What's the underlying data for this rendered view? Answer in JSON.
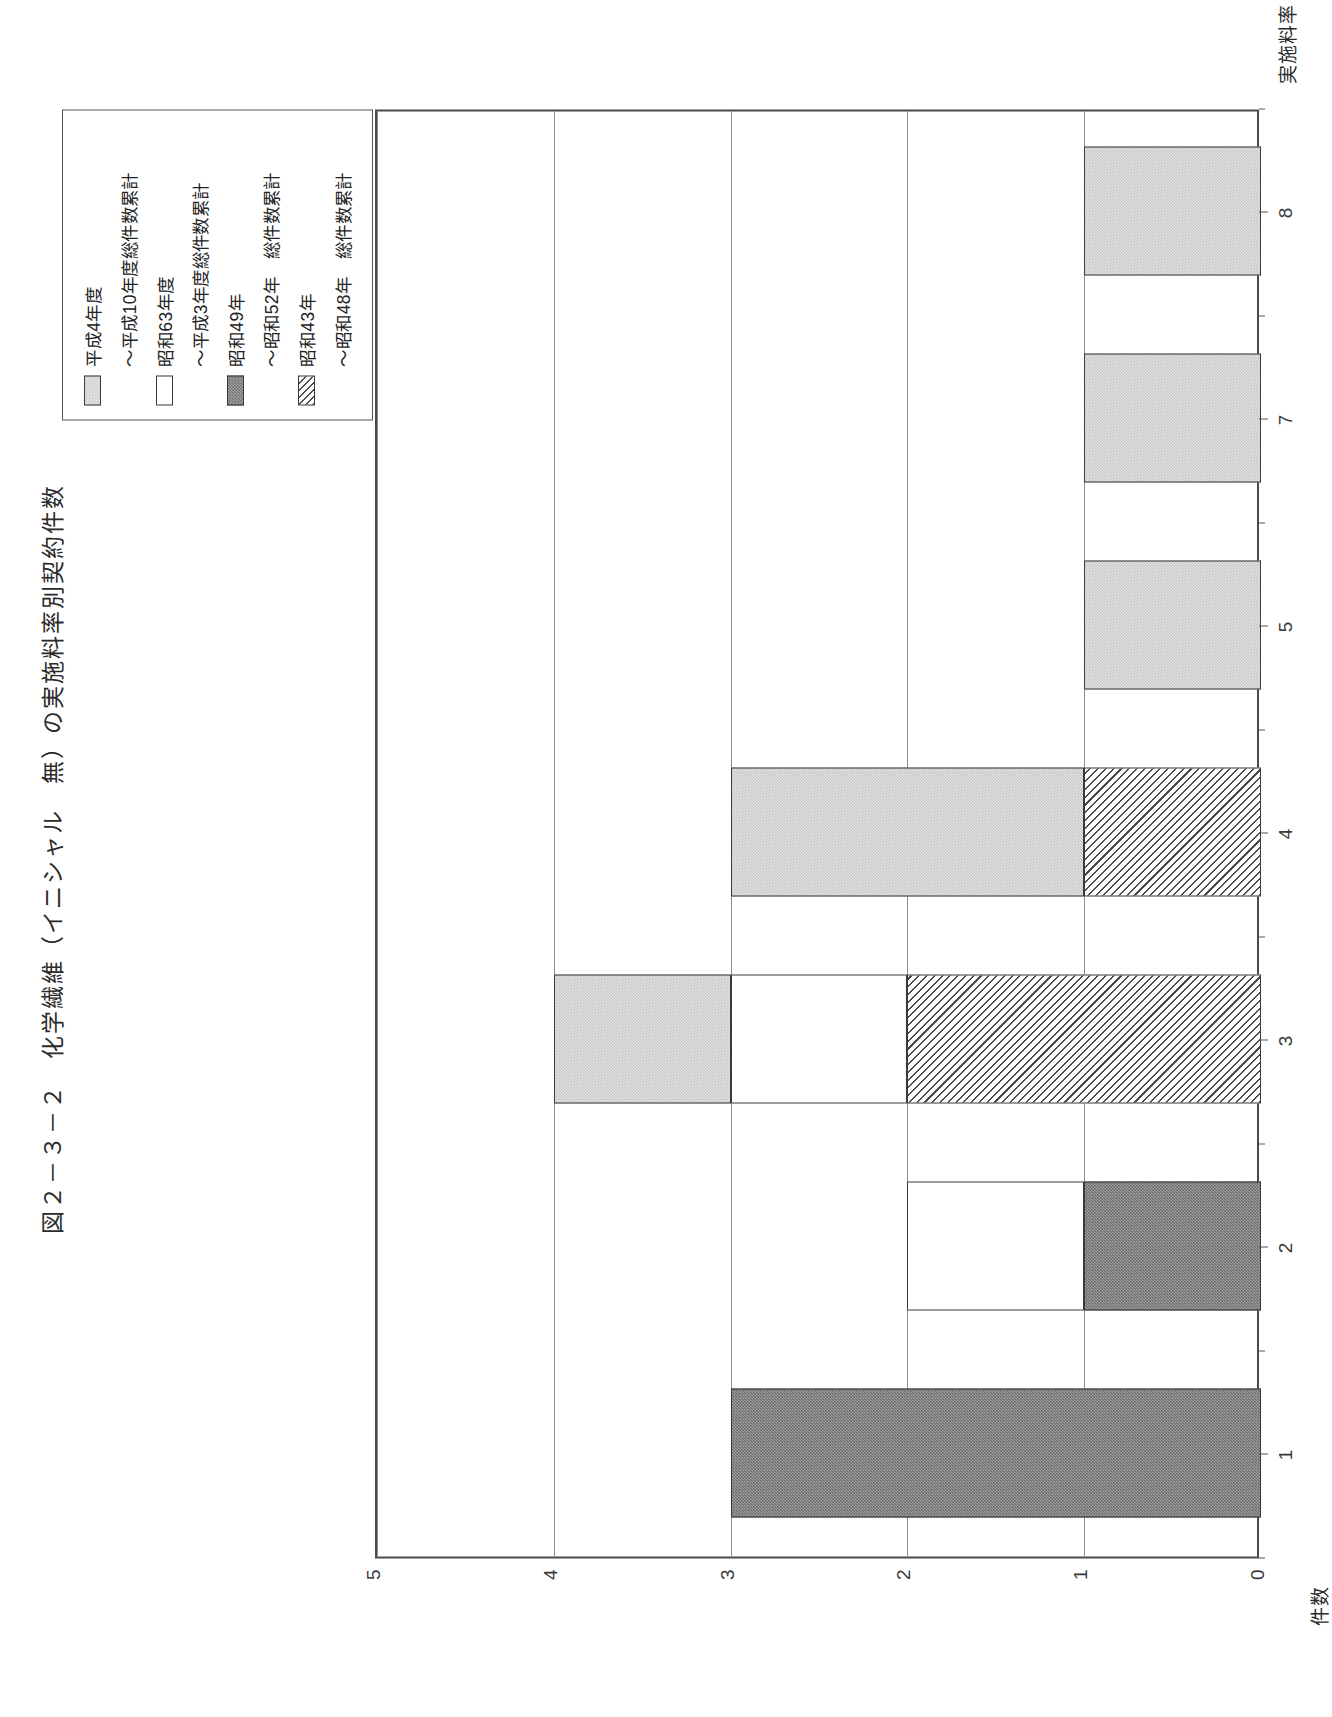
{
  "figure": {
    "title": "図２－３－２　化学繊維（イニシャル　無）の実施料率別契約件数"
  },
  "legend": {
    "entries": [
      {
        "label": "平成4年度",
        "swatch": "dot-light"
      },
      {
        "label": "〜平成10年度総件数累計",
        "swatch": "none"
      },
      {
        "label": "昭和63年度",
        "swatch": "blank"
      },
      {
        "label": "〜平成3年度総件数累計",
        "swatch": "none"
      },
      {
        "label": "昭和49年",
        "swatch": "dot-dark"
      },
      {
        "label": "〜昭和52年　総件数累計",
        "swatch": "none"
      },
      {
        "label": "昭和43年",
        "swatch": "hatch"
      },
      {
        "label": "〜昭和48年　総件数累計",
        "swatch": "none"
      }
    ]
  },
  "axes": {
    "x_label": "実施料率（％）",
    "y_label": "件数",
    "x_ticks": [
      "1",
      "2",
      "3",
      "4",
      "5",
      "7",
      "8"
    ],
    "y_ticks": [
      "0",
      "1",
      "2",
      "3",
      "4",
      "5"
    ]
  },
  "chart_data": {
    "type": "bar",
    "orientation": "vertical-stacked",
    "title": "図２－３－２　化学繊維（イニシャル　無）の実施料率別契約件数",
    "xlabel": "実施料率（％）",
    "ylabel": "件数",
    "categories": [
      "1",
      "2",
      "3",
      "4",
      "5",
      "7",
      "8"
    ],
    "ylim": [
      0,
      5
    ],
    "y_ticks": [
      0,
      1,
      2,
      3,
      4,
      5
    ],
    "grid": true,
    "legend_position": "top-right",
    "series": [
      {
        "name": "昭和43年〜昭和48年　総件数累計",
        "swatch": "hatch",
        "values": [
          0,
          0,
          2,
          1,
          0,
          0,
          0
        ]
      },
      {
        "name": "昭和49年〜昭和52年　総件数累計",
        "swatch": "dot-dark",
        "values": [
          3,
          1,
          0,
          0,
          0,
          0,
          0
        ]
      },
      {
        "name": "昭和63年度〜平成3年度総件数累計",
        "swatch": "blank",
        "values": [
          0,
          1,
          1,
          0,
          0,
          0,
          0
        ]
      },
      {
        "name": "平成4年度〜平成10年度総件数累計",
        "swatch": "dot-light",
        "values": [
          0,
          0,
          1,
          2,
          1,
          1,
          1
        ]
      }
    ],
    "totals": [
      3,
      2,
      4,
      3,
      1,
      1,
      1
    ]
  }
}
